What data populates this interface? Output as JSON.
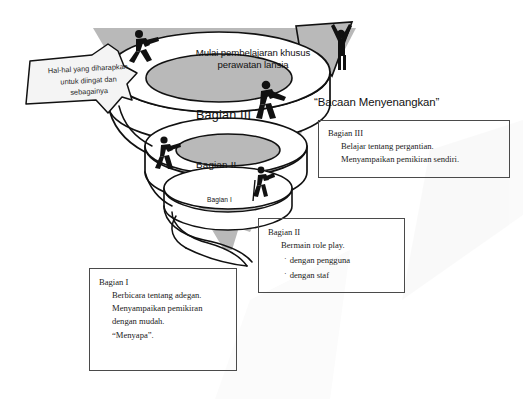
{
  "diagram": {
    "arrow_caption": {
      "line1": "Mulai pembelajaran khusus",
      "line2": "perawatan lansia"
    },
    "banner_callout": {
      "line1": "Hal-hal yang diharapkan",
      "line2": "untuk diingat dan",
      "line3": "sebagainya"
    },
    "spiral_labels": {
      "tier3": "Bagian III",
      "tier2": "Bagian II",
      "tier1": "Bagian I"
    },
    "figures": [
      {
        "name": "climbing-person-upper-left",
        "pose": "climbing"
      },
      {
        "name": "cheering-person-arrow-tip",
        "pose": "arms-raised"
      },
      {
        "name": "walking-person-tier-three",
        "pose": "walking"
      },
      {
        "name": "climbing-person-tier-two",
        "pose": "climbing"
      },
      {
        "name": "climbing-person-tier-one",
        "pose": "climbing"
      }
    ],
    "colors": {
      "funnel_grey": "#b9b9b9",
      "arrow_grey": "#b9b9b9",
      "ramp_white": "#ffffff",
      "ink": "#111111",
      "figure_black": "#111111"
    }
  },
  "quote_heading": "“Bacaan Menyenangkan”",
  "notes": {
    "three": {
      "title": "Bagian III",
      "lines": [
        "Belajar tentang pergantian.",
        "Menyampaikan pemikiran sendiri."
      ]
    },
    "two": {
      "title": "Bagian II",
      "lines": [
        "Bermain role play."
      ],
      "bullet_char": "·",
      "bullets": [
        "dengan pengguna",
        "dengan staf"
      ]
    },
    "one": {
      "title": "Bagian I",
      "lines": [
        "Berbicara tentang adegan.",
        "Menyampaikan pemikiran",
        "dengan mudah.",
        "“Menyapa”."
      ]
    }
  }
}
